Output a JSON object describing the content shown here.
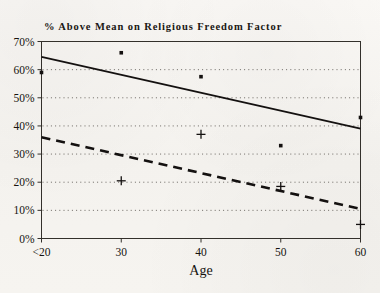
{
  "chart_data": {
    "type": "scatter",
    "title": "% Above Mean on Religious Freedom Factor",
    "xlabel": "Age",
    "ylabel": "",
    "xlim": [
      20,
      60
    ],
    "ylim": [
      0,
      70
    ],
    "grid": true,
    "legend": "none",
    "x_tick_labels": [
      "<20",
      "30",
      "40",
      "50",
      "60"
    ],
    "x_tick_values": [
      20,
      30,
      40,
      50,
      60
    ],
    "y_tick_labels": [
      "0%",
      "10%",
      "20%",
      "30%",
      "40%",
      "50%",
      "60%",
      "70%"
    ],
    "y_tick_values": [
      0,
      10,
      20,
      30,
      40,
      50,
      60,
      70
    ],
    "series": [
      {
        "name": "Upper group (square markers)",
        "marker": "square",
        "points": [
          {
            "x": 20,
            "y": 59
          },
          {
            "x": 30,
            "y": 66
          },
          {
            "x": 40,
            "y": 57.5
          },
          {
            "x": 50,
            "y": 33
          },
          {
            "x": 60,
            "y": 43
          }
        ]
      },
      {
        "name": "Lower group (plus markers)",
        "marker": "plus",
        "points": [
          {
            "x": 30,
            "y": 20.5
          },
          {
            "x": 40,
            "y": 37
          },
          {
            "x": 50,
            "y": 18.5
          },
          {
            "x": 60,
            "y": 5
          }
        ]
      }
    ],
    "trend_lines": [
      {
        "name": "Solid trend line",
        "style": "solid",
        "x": [
          20,
          60
        ],
        "y": [
          64.5,
          39
        ]
      },
      {
        "name": "Dashed trend line",
        "style": "dashed",
        "x": [
          20,
          60
        ],
        "y": [
          36,
          10.5
        ]
      }
    ]
  }
}
